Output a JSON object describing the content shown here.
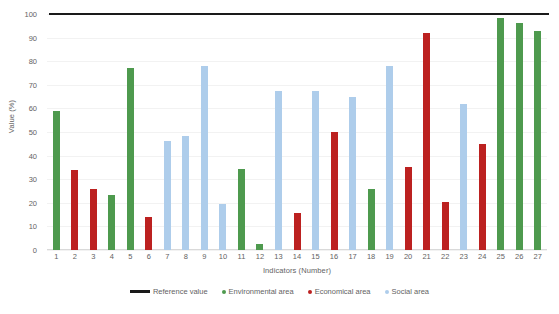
{
  "chart_data": {
    "type": "bar",
    "title": "",
    "xlabel": "Indicators (Number)",
    "ylabel": "Value (%)",
    "ylim": [
      0,
      100
    ],
    "ytick_step": 10,
    "yticks": [
      0,
      10,
      20,
      30,
      40,
      50,
      60,
      70,
      80,
      90,
      100
    ],
    "grid": true,
    "legend_position": "bottom",
    "categories": [
      "1",
      "2",
      "3",
      "4",
      "5",
      "6",
      "7",
      "8",
      "9",
      "10",
      "11",
      "12",
      "13",
      "14",
      "15",
      "16",
      "17",
      "18",
      "19",
      "20",
      "21",
      "22",
      "23",
      "24",
      "25",
      "26",
      "27"
    ],
    "values": [
      59,
      34,
      26,
      23.5,
      77,
      14,
      46,
      48.5,
      78,
      19.5,
      34.5,
      2.5,
      67.5,
      15.5,
      67.5,
      50,
      65,
      26,
      78,
      35,
      92,
      20.5,
      62,
      45,
      98.5,
      96,
      93
    ],
    "areas": [
      "env",
      "econ",
      "econ",
      "env",
      "env",
      "econ",
      "soc",
      "soc",
      "soc",
      "soc",
      "env",
      "env",
      "soc",
      "econ",
      "soc",
      "econ",
      "soc",
      "env",
      "soc",
      "econ",
      "econ",
      "econ",
      "soc",
      "econ",
      "env",
      "env",
      "env"
    ],
    "reference_value": 100,
    "reference_label": "Reference value",
    "series": [
      {
        "name": "Environmental area",
        "key": "env",
        "color": "#4e9a4e"
      },
      {
        "name": "Economical area",
        "key": "econ",
        "color": "#bc2120"
      },
      {
        "name": "Social area",
        "key": "soc",
        "color": "#aecdeb"
      }
    ]
  },
  "legend": {
    "reference": "Reference value",
    "environmental": "Environmental area",
    "economical": "Economical area",
    "social": "Social area"
  },
  "axes": {
    "x_title": "Indicators (Number)",
    "y_title": "Value (%)"
  },
  "colors": {
    "environmental": "#4e9a4e",
    "economical": "#bc2120",
    "social": "#aecdeb",
    "reference_line": "#1a1a1a",
    "gridline": "#f2f2f2",
    "text": "#636363"
  }
}
